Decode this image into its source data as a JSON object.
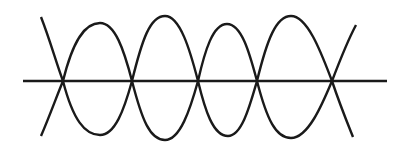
{
  "diagram": {
    "stroke_color": "#1a1a1a",
    "background": "#ffffff",
    "axis": {
      "x1": 23,
      "x2": 387,
      "y": 81
    },
    "nodes_x": [
      63,
      132,
      198,
      257,
      332
    ],
    "wave_upper_first": {
      "start": [
        41,
        17
      ],
      "peaks": [
        [
          100,
          23
        ],
        [
          165,
          16
        ],
        [
          227,
          24
        ],
        [
          291,
          16
        ]
      ],
      "end": [
        353,
        137
      ]
    },
    "wave_lower_first": {
      "start": [
        41,
        136
      ],
      "troughs": [
        [
          100,
          135
        ],
        [
          165,
          140
        ],
        [
          228,
          136
        ],
        [
          291,
          138
        ]
      ],
      "end": [
        356,
        25
      ]
    }
  }
}
